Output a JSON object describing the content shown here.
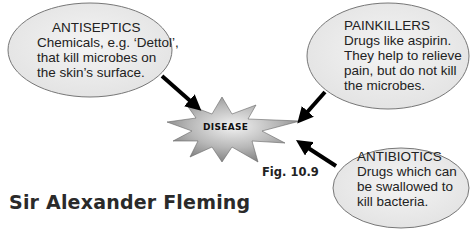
{
  "diagram": {
    "center": {
      "label": "DISEASE",
      "shape": "star-burst",
      "fill_light": "#e8e8e8",
      "fill_dark": "#8a8a8a"
    },
    "bubbles": [
      {
        "id": "antiseptics",
        "title": "ANTISEPTICS",
        "lines": [
          "Chemicals, e.g. ‘Dettol’,",
          "that kill microbes on",
          "the skin’s surface."
        ]
      },
      {
        "id": "painkillers",
        "title": "PAINKILLERS",
        "lines": [
          "Drugs like aspirin.",
          "They help to relieve",
          "pain, but do not kill",
          "the microbes."
        ]
      },
      {
        "id": "antibiotics",
        "title": "ANTIBIOTICS",
        "lines": [
          "Drugs which can",
          "be swallowed to",
          "kill bacteria."
        ]
      }
    ],
    "figure_label": "Fig. 10.9",
    "colors": {
      "bubble_fill": "#ececec",
      "bubble_stroke": "#777777",
      "arrow": "#000000"
    }
  },
  "section": {
    "heading": "Sir Alexander Fleming"
  }
}
